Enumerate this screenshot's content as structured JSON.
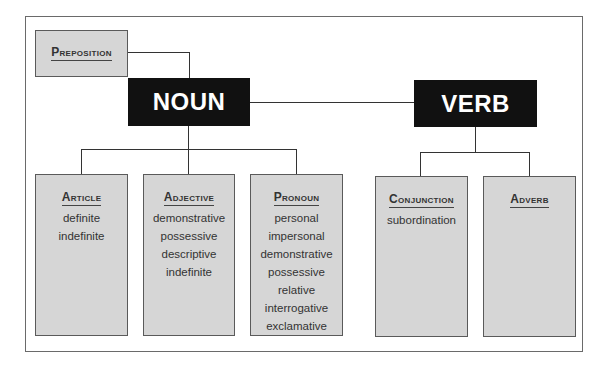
{
  "diagram": {
    "top_left": {
      "label": "Preposition"
    },
    "main_nodes": [
      {
        "label": "NOUN"
      },
      {
        "label": "VERB"
      }
    ],
    "noun_children": [
      {
        "title": "Article",
        "items": [
          "definite",
          "indefinite"
        ]
      },
      {
        "title": "Adjective",
        "items": [
          "demonstrative",
          "possessive",
          "descriptive",
          "indefinite"
        ]
      },
      {
        "title": "Pronoun",
        "items": [
          "personal",
          "impersonal",
          "demonstrative",
          "possessive",
          "relative",
          "interrogative",
          "exclamative"
        ]
      }
    ],
    "verb_children": [
      {
        "title": "Conjunction",
        "items": [
          "subordination"
        ]
      },
      {
        "title": "Adverb",
        "items": []
      }
    ],
    "colors": {
      "box_fill": "#d6d6d6",
      "main_node_fill": "#111111",
      "main_node_text": "#ffffff",
      "line": "#333333"
    }
  }
}
